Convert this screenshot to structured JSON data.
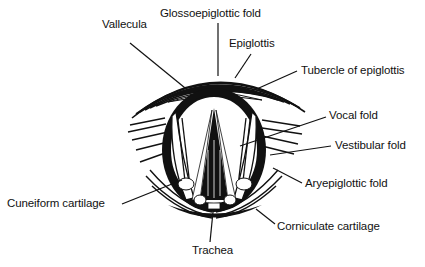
{
  "diagram": {
    "labels": [
      {
        "id": "vallecula",
        "text": "Vallecula",
        "x": 102,
        "y": 18
      },
      {
        "id": "glossoepiglottic-fold",
        "text": "Glossoepiglottic fold",
        "x": 160,
        "y": 7
      },
      {
        "id": "epiglottis",
        "text": "Epiglottis",
        "x": 229,
        "y": 37
      },
      {
        "id": "tubercle-of-epiglottis",
        "text": "Tubercle of epiglottis",
        "x": 301,
        "y": 64
      },
      {
        "id": "vocal-fold",
        "text": "Vocal fold",
        "x": 329,
        "y": 109
      },
      {
        "id": "vestibular-fold",
        "text": "Vestibular fold",
        "x": 335,
        "y": 139
      },
      {
        "id": "aryepiglottic-fold",
        "text": "Aryepiglottic fold",
        "x": 305,
        "y": 177
      },
      {
        "id": "cuneiform-cartilage",
        "text": "Cuneiform cartilage",
        "x": 7,
        "y": 197
      },
      {
        "id": "corniculate-cartilage",
        "text": "Corniculate cartilage",
        "x": 277,
        "y": 220
      },
      {
        "id": "trachea",
        "text": "Trachea",
        "x": 192,
        "y": 244
      }
    ],
    "leaders": [
      {
        "to": "vallecula",
        "x1": 130,
        "y1": 43,
        "x2": 190,
        "y2": 92
      },
      {
        "to": "glossoepiglottic-fold",
        "x1": 218,
        "y1": 23,
        "x2": 218,
        "y2": 76
      },
      {
        "to": "epiglottis",
        "x1": 251,
        "y1": 54,
        "x2": 235,
        "y2": 78
      },
      {
        "to": "tubercle-of-epiglottis",
        "x1": 297,
        "y1": 71,
        "x2": 250,
        "y2": 92
      },
      {
        "to": "vocal-fold",
        "x1": 326,
        "y1": 117,
        "x2": 240,
        "y2": 146
      },
      {
        "to": "vestibular-fold",
        "x1": 331,
        "y1": 146,
        "x2": 270,
        "y2": 155
      },
      {
        "to": "aryepiglottic-fold",
        "x1": 302,
        "y1": 183,
        "x2": 273,
        "y2": 168
      },
      {
        "to": "cuneiform-cartilage",
        "x1": 122,
        "y1": 204,
        "x2": 182,
        "y2": 180
      },
      {
        "to": "corniculate-cartilage",
        "x1": 275,
        "y1": 224,
        "x2": 256,
        "y2": 209
      },
      {
        "to": "trachea",
        "x1": 210,
        "y1": 242,
        "x2": 213,
        "y2": 212
      }
    ]
  }
}
